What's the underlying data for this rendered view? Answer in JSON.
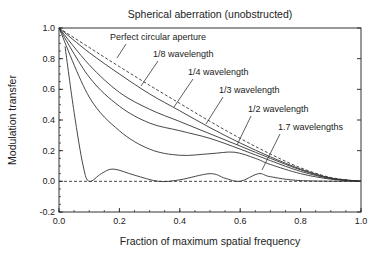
{
  "chart_data": {
    "type": "line",
    "title": "Spherical aberration (unobstructed)",
    "xlabel": "Fraction of maximum spatial frequency",
    "ylabel": "Modulation transfer",
    "xlim": [
      0.0,
      1.0
    ],
    "ylim": [
      -0.2,
      1.0
    ],
    "xticks": [
      "0.0",
      "0.2",
      "0.4",
      "0.6",
      "0.8",
      "1.0"
    ],
    "yticks": [
      "1.0",
      "0.8",
      "0.6",
      "0.4",
      "0.2",
      "0.0",
      "-0.2"
    ],
    "grid": false,
    "legend": "inline annotations with leader lines",
    "series": [
      {
        "name": "Perfect circular aperture",
        "style": "dashed",
        "x": [
          0.0,
          0.1,
          0.2,
          0.3,
          0.4,
          0.5,
          0.6,
          0.7,
          0.8,
          0.9,
          1.0
        ],
        "y": [
          1.0,
          0.873,
          0.748,
          0.626,
          0.508,
          0.391,
          0.28,
          0.178,
          0.088,
          0.025,
          0.0
        ]
      },
      {
        "name": "1/8 wavelength",
        "style": "solid",
        "x": [
          0.0,
          0.1,
          0.2,
          0.3,
          0.4,
          0.5,
          0.6,
          0.7,
          0.8,
          0.9,
          1.0
        ],
        "y": [
          1.0,
          0.84,
          0.7,
          0.57,
          0.46,
          0.35,
          0.25,
          0.16,
          0.08,
          0.022,
          0.0
        ]
      },
      {
        "name": "1/4 wavelength",
        "style": "solid",
        "x": [
          0.0,
          0.1,
          0.2,
          0.3,
          0.4,
          0.5,
          0.6,
          0.7,
          0.8,
          0.9,
          1.0
        ],
        "y": [
          1.0,
          0.76,
          0.58,
          0.47,
          0.39,
          0.31,
          0.23,
          0.15,
          0.075,
          0.02,
          0.0
        ]
      },
      {
        "name": "1/3 wavelength",
        "style": "solid",
        "x": [
          0.0,
          0.1,
          0.2,
          0.3,
          0.4,
          0.5,
          0.6,
          0.7,
          0.8,
          0.9,
          1.0
        ],
        "y": [
          1.0,
          0.68,
          0.49,
          0.38,
          0.33,
          0.28,
          0.21,
          0.135,
          0.065,
          0.018,
          0.0
        ]
      },
      {
        "name": "1/2 wavelength",
        "style": "solid",
        "x": [
          0.0,
          0.1,
          0.2,
          0.3,
          0.4,
          0.5,
          0.58,
          0.65,
          0.7,
          0.8,
          0.9,
          1.0
        ],
        "y": [
          1.0,
          0.55,
          0.33,
          0.21,
          0.17,
          0.18,
          0.19,
          0.15,
          0.11,
          0.05,
          0.014,
          0.0
        ]
      },
      {
        "name": "1.7 wavelengths",
        "style": "solid",
        "x": [
          0.02,
          0.05,
          0.08,
          0.1,
          0.14,
          0.18,
          0.25,
          0.33,
          0.4,
          0.5,
          0.55,
          0.6,
          0.66,
          0.7,
          0.8,
          1.0
        ],
        "y": [
          0.88,
          0.45,
          0.1,
          0.0,
          0.05,
          0.08,
          0.04,
          0.0,
          0.01,
          0.05,
          0.02,
          0.0,
          0.05,
          0.03,
          0.005,
          0.0
        ]
      }
    ],
    "annotations": [
      {
        "text": "Perfect circular aperture",
        "x": 110,
        "y": 40,
        "leader": [
          [
            126,
            44
          ],
          [
            117,
            58
          ]
        ]
      },
      {
        "text": "1/8 wavelength",
        "x": 153,
        "y": 57,
        "leader": [
          [
            158,
            61
          ],
          [
            141,
            86
          ]
        ]
      },
      {
        "text": "1/4 wavelength",
        "x": 188,
        "y": 75,
        "leader": [
          [
            193,
            79
          ],
          [
            174,
            107
          ]
        ]
      },
      {
        "text": "1/3 wavelength",
        "x": 219,
        "y": 93,
        "leader": [
          [
            223,
            97
          ],
          [
            206,
            124
          ]
        ]
      },
      {
        "text": "1/2 wavelength",
        "x": 248,
        "y": 112,
        "leader": [
          [
            251,
            116
          ],
          [
            237,
            145
          ]
        ]
      },
      {
        "text": "1.7 wavelengths",
        "x": 278,
        "y": 130,
        "leader": [
          [
            280,
            134
          ],
          [
            262,
            170
          ]
        ]
      }
    ],
    "zero_line": {
      "y": 0.0,
      "style": "dashed"
    }
  }
}
